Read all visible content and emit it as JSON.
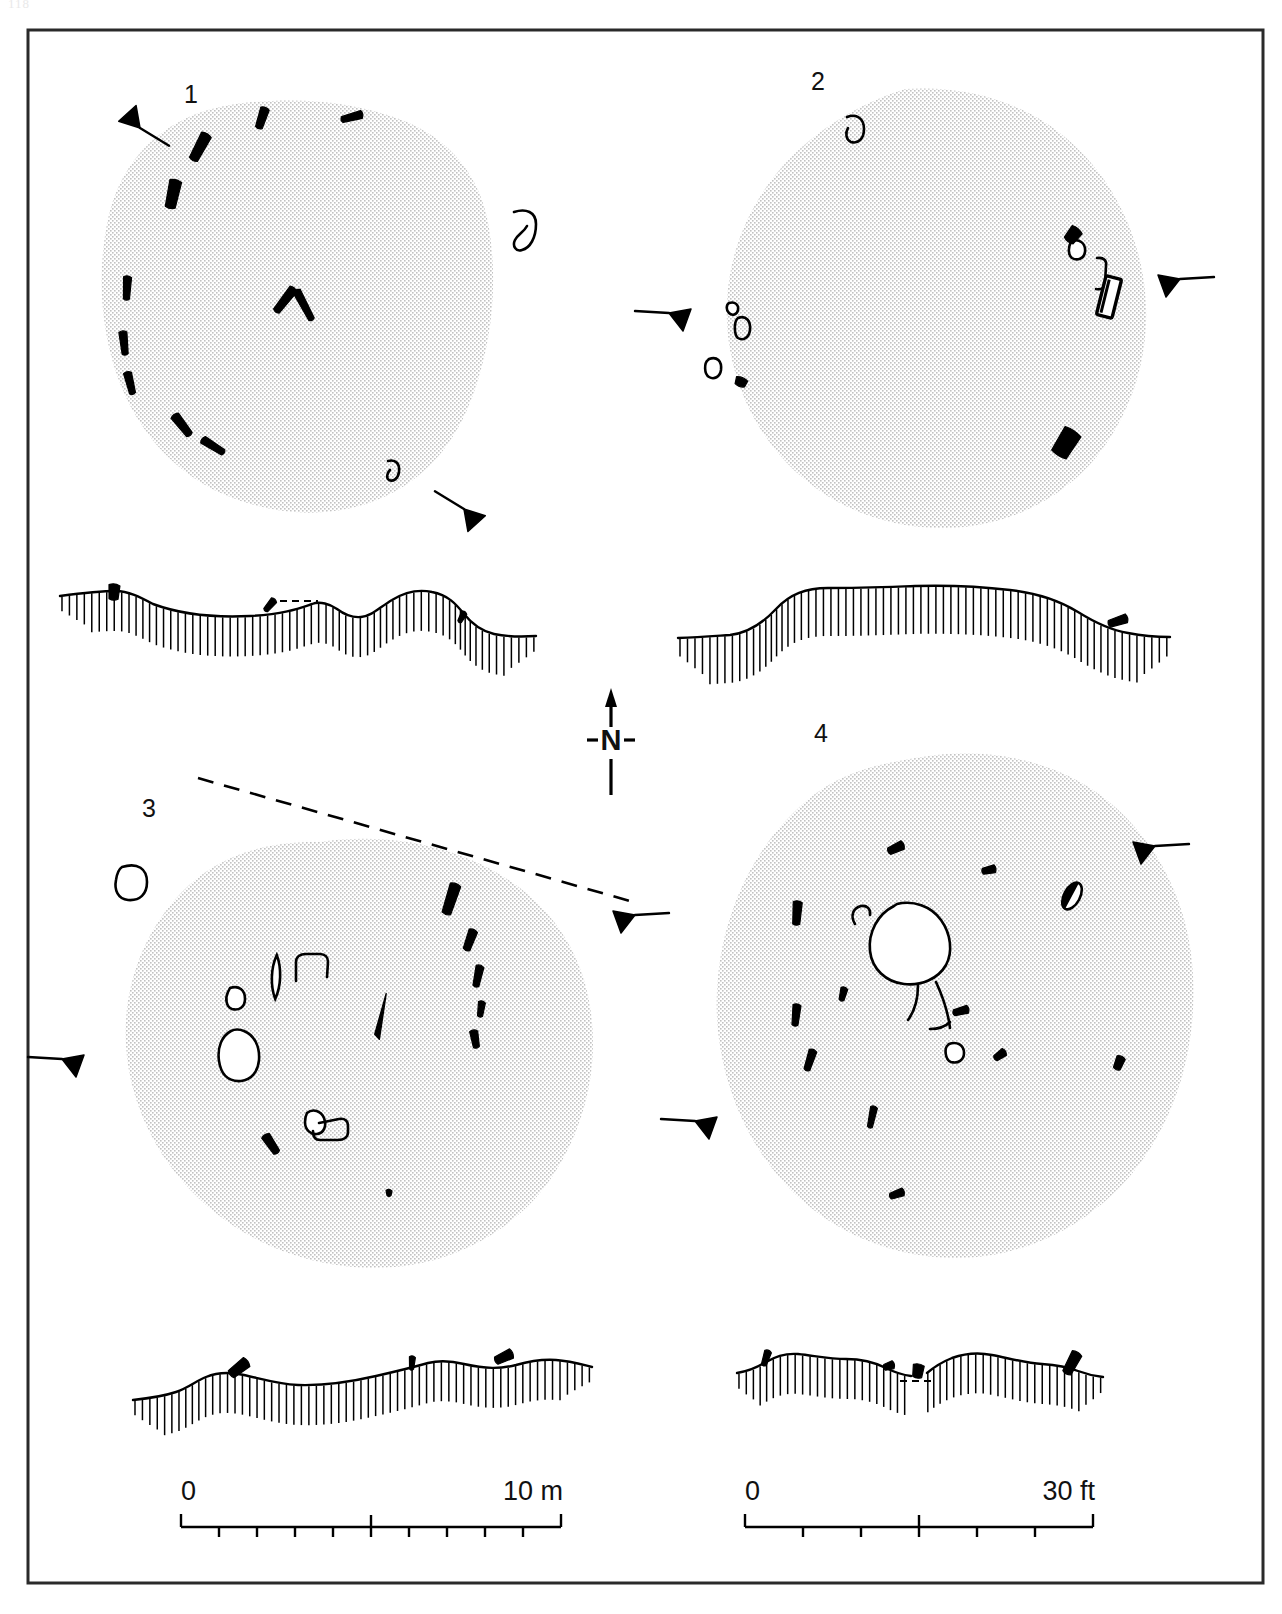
{
  "figure": {
    "page_number": "118",
    "border_color": "#2a2a2a",
    "stipple_color": "#b9b9b9",
    "ink_color": "#000000"
  },
  "north_arrow": {
    "label": "N",
    "name": "north-arrow"
  },
  "plans": [
    {
      "id": "plan-1",
      "label": "1",
      "label_x": 191,
      "label_y": 103,
      "outline": "M 243,103 C 300,97 352,101 402,120 C 450,139 481,176 489,228 C 498,283 492,341 474,392 C 456,444 424,481 377,500 C 327,520 271,515 223,494 C 173,472 137,430 118,378 C 100,327 97,272 108,219 C 119,169 150,132 196,114 C 212,108 228,105 243,103 Z",
      "stones": [
        {
          "name": "stone",
          "type": "slab",
          "x": 200,
          "y": 147,
          "w": 11,
          "h": 30,
          "rot": 28,
          "fill": "solid"
        },
        {
          "name": "stone",
          "type": "slab",
          "x": 262,
          "y": 118,
          "w": 9,
          "h": 22,
          "rot": 18,
          "fill": "solid"
        },
        {
          "name": "stone",
          "type": "slab",
          "x": 352,
          "y": 117,
          "w": 8,
          "h": 22,
          "rot": 75,
          "fill": "solid"
        },
        {
          "name": "stone",
          "type": "slab",
          "x": 173,
          "y": 194,
          "w": 12,
          "h": 29,
          "rot": 12,
          "fill": "solid"
        },
        {
          "name": "stone",
          "type": "slab",
          "x": 127,
          "y": 288,
          "w": 8,
          "h": 24,
          "rot": 3,
          "fill": "solid"
        },
        {
          "name": "stone",
          "type": "slab",
          "x": 124,
          "y": 343,
          "w": 8,
          "h": 24,
          "rot": -6,
          "fill": "solid"
        },
        {
          "name": "stone",
          "type": "slab",
          "x": 130,
          "y": 383,
          "w": 8,
          "h": 23,
          "rot": -14,
          "fill": "solid"
        },
        {
          "name": "stone",
          "type": "slab",
          "x": 182,
          "y": 425,
          "w": 9,
          "h": 26,
          "rot": -38,
          "fill": "solid"
        },
        {
          "name": "stone",
          "type": "slab",
          "x": 213,
          "y": 446,
          "w": 8,
          "h": 26,
          "rot": -58,
          "fill": "solid"
        },
        {
          "name": "stone",
          "type": "chevron-left",
          "x": 285,
          "y": 300,
          "w": 9,
          "h": 30,
          "rot": 38,
          "fill": "solid"
        },
        {
          "name": "stone",
          "type": "chevron-right",
          "x": 304,
          "y": 305,
          "w": 8,
          "h": 34,
          "rot": -28,
          "fill": "solid"
        }
      ],
      "hollow_features": [
        {
          "name": "hollow-stone",
          "path": "M 514,212 C 526,208 536,212 536,224 C 536,238 530,248 522,250 C 516,252 512,246 515,240 C 518,234 524,232 527,226",
          "closed": false
        },
        {
          "name": "hollow-stone",
          "path": "M 388,461 C 396,459 400,464 399,472 C 398,479 393,482 389,480 C 386,478 387,473 390,470",
          "closed": false
        }
      ],
      "section_markers": [
        {
          "name": "section-marker",
          "x": 140,
          "y": 128,
          "rot": 208,
          "flip": false
        },
        {
          "name": "section-marker",
          "x": 464,
          "y": 509,
          "rot": 28,
          "flip": false
        }
      ]
    },
    {
      "id": "plan-2",
      "label": "2",
      "label_x": 818,
      "label_y": 90,
      "outline": "M 905,89 C 965,85 1022,101 1066,138 C 1112,177 1139,232 1145,291 C 1151,351 1134,409 1098,455 C 1061,501 1005,527 946,528 C 886,529 828,506 787,463 C 746,420 724,361 727,301 C 730,242 757,187 802,147 C 831,121 867,101 905,89 Z",
      "stones": [
        {
          "name": "stone",
          "type": "slab",
          "x": 1073,
          "y": 235,
          "w": 13,
          "h": 16,
          "rot": 38,
          "fill": "solid"
        },
        {
          "name": "stone",
          "type": "slab",
          "x": 1109,
          "y": 297,
          "w": 16,
          "h": 40,
          "rot": 14,
          "fill": "outline-bar"
        },
        {
          "name": "stone",
          "type": "slab",
          "x": 1066,
          "y": 443,
          "w": 19,
          "h": 29,
          "rot": 32,
          "fill": "solid"
        },
        {
          "name": "stone",
          "type": "slab",
          "x": 741,
          "y": 382,
          "w": 12,
          "h": 9,
          "rot": 20,
          "fill": "solid"
        }
      ],
      "hollow_features": [
        {
          "name": "hollow-stone",
          "path": "M 847,117 C 857,113 864,119 864,129 C 864,139 858,144 851,142 C 846,140 845,133 848,128",
          "closed": false
        },
        {
          "name": "hollow-stone",
          "path": "M 1071,241 C 1080,238 1086,244 1085,252 C 1084,259 1077,261 1072,258 C 1068,255 1068,247 1071,242 Z",
          "closed": true
        },
        {
          "name": "hollow-stone",
          "path": "M 1097,258 C 1104,257 1107,261 1106,266 L 1105,283 C 1105,288 1101,290 1096,289",
          "closed": false
        },
        {
          "name": "hollow-stone",
          "path": "M 729,303 C 735,301 739,305 738,310 C 737,315 732,316 729,313 C 726,310 726,305 729,303 Z",
          "closed": true
        },
        {
          "name": "hollow-stone",
          "path": "M 738,318 C 746,315 751,321 750,330 C 749,338 743,341 738,338 C 734,335 734,323 737,319",
          "closed": false
        },
        {
          "name": "hollow-stone",
          "path": "M 709,359 C 717,356 722,361 721,370 C 720,377 714,380 709,377 C 704,374 704,363 708,360 Z",
          "closed": true
        }
      ],
      "section_markers": [
        {
          "name": "section-marker",
          "x": 669,
          "y": 313,
          "rot": 0,
          "flip": false
        },
        {
          "name": "section-marker",
          "x": 1180,
          "y": 279,
          "rot": 0,
          "flip": true
        }
      ]
    },
    {
      "id": "plan-3",
      "label": "3",
      "label_x": 149,
      "label_y": 817,
      "outline": "M 320,842 C 383,833 446,843 499,874 C 552,905 584,955 591,1013 C 599,1074 582,1136 547,1184 C 510,1233 454,1262 395,1267 C 331,1272 267,1253 217,1214 C 167,1175 134,1118 127,1057 C 120,996 140,936 181,893 C 218,854 268,841 320,842 Z",
      "stones": [
        {
          "name": "stone",
          "type": "slab",
          "x": 451,
          "y": 899,
          "w": 11,
          "h": 32,
          "rot": 18,
          "fill": "solid"
        },
        {
          "name": "stone",
          "type": "slab",
          "x": 470,
          "y": 940,
          "w": 9,
          "h": 22,
          "rot": 20,
          "fill": "solid"
        },
        {
          "name": "stone",
          "type": "slab",
          "x": 478,
          "y": 976,
          "w": 8,
          "h": 22,
          "rot": 12,
          "fill": "solid"
        },
        {
          "name": "stone",
          "type": "slab",
          "x": 481,
          "y": 1009,
          "w": 7,
          "h": 16,
          "rot": 8,
          "fill": "solid"
        },
        {
          "name": "stone",
          "type": "slab",
          "x": 475,
          "y": 1039,
          "w": 8,
          "h": 18,
          "rot": -10,
          "fill": "solid"
        },
        {
          "name": "stone",
          "type": "slab",
          "x": 271,
          "y": 1144,
          "w": 9,
          "h": 22,
          "rot": -34,
          "fill": "solid"
        },
        {
          "name": "stone",
          "type": "slab",
          "x": 389,
          "y": 1193,
          "w": 6,
          "h": 7,
          "rot": 0,
          "fill": "solid"
        },
        {
          "name": "stone",
          "type": "slab",
          "x": 381,
          "y": 1016,
          "w": 8,
          "h": 46,
          "rot": 13,
          "fill": "thin-solid"
        },
        {
          "name": "stone",
          "type": "slab",
          "x": 276,
          "y": 977,
          "w": 11,
          "h": 44,
          "rot": 2,
          "fill": "lens"
        }
      ],
      "hollow_features": [
        {
          "name": "hollow-stone",
          "path": "M 122,867 C 138,862 147,869 147,882 C 147,894 140,901 128,900 C 118,899 114,890 116,880 C 117,873 119,869 122,867 Z",
          "closed": true
        },
        {
          "name": "hollow-stone",
          "path": "M 231,1031 C 222,1036 217,1047 219,1061 C 221,1075 229,1082 241,1081 C 251,1080 258,1072 259,1060 C 260,1046 254,1035 244,1031 C 239,1029 235,1029 231,1031 Z",
          "closed": true
        },
        {
          "name": "hollow-stone",
          "path": "M 230,988 C 239,985 245,990 245,999 C 245,1007 239,1011 232,1009 C 226,1007 225,998 228,992 Z",
          "closed": true
        },
        {
          "name": "hollow-stone",
          "path": "M 296,981 L 296,962 C 296,957 300,954 306,954 L 320,954 C 325,954 328,957 328,962 L 327,977",
          "closed": false
        },
        {
          "name": "hollow-stone",
          "path": "M 307,1113 C 313,1108 321,1111 324,1118 C 327,1126 324,1133 317,1134 C 311,1135 305,1130 305,1122 C 305,1118 306,1115 307,1113 Z",
          "closed": true
        },
        {
          "name": "hollow-stone",
          "path": "M 319,1123 L 339,1119 C 345,1118 348,1121 348,1126 L 348,1132 C 348,1137 344,1140 338,1140 L 320,1140 C 315,1140 313,1136 313,1131",
          "closed": false
        }
      ],
      "section_markers": [
        {
          "name": "section-marker",
          "x": 62,
          "y": 1059,
          "rot": 0,
          "flip": false
        },
        {
          "name": "section-marker",
          "x": 635,
          "y": 915,
          "rot": 0,
          "flip": true
        }
      ],
      "dashed_line": "M 198,778 L 630,901"
    },
    {
      "id": "plan-4",
      "label": "4",
      "label_x": 821,
      "label_y": 742,
      "outline": "M 922,757 C 990,746 1059,761 1108,801 C 1160,844 1190,907 1193,975 C 1197,1050 1175,1123 1130,1176 C 1085,1229 1019,1259 953,1258 C 884,1257 818,1226 775,1172 C 731,1117 711,1045 718,977 C 725,903 760,836 815,794 C 847,770 884,763 922,757 Z",
      "stones": [
        {
          "name": "stone",
          "type": "slab",
          "x": 896,
          "y": 848,
          "w": 9,
          "h": 17,
          "rot": 65,
          "fill": "solid"
        },
        {
          "name": "stone",
          "type": "slab",
          "x": 989,
          "y": 870,
          "w": 8,
          "h": 14,
          "rot": 78,
          "fill": "solid"
        },
        {
          "name": "stone",
          "type": "slab",
          "x": 1072,
          "y": 896,
          "w": 16,
          "h": 29,
          "rot": 28,
          "fill": "half"
        },
        {
          "name": "stone",
          "type": "slab",
          "x": 797,
          "y": 913,
          "w": 9,
          "h": 24,
          "rot": 4,
          "fill": "solid"
        },
        {
          "name": "stone",
          "type": "slab",
          "x": 843,
          "y": 994,
          "w": 7,
          "h": 14,
          "rot": 14,
          "fill": "solid"
        },
        {
          "name": "stone",
          "type": "slab",
          "x": 796,
          "y": 1015,
          "w": 8,
          "h": 22,
          "rot": 6,
          "fill": "solid"
        },
        {
          "name": "stone",
          "type": "slab",
          "x": 810,
          "y": 1060,
          "w": 8,
          "h": 22,
          "rot": 18,
          "fill": "solid"
        },
        {
          "name": "stone",
          "type": "slab",
          "x": 872,
          "y": 1117,
          "w": 7,
          "h": 22,
          "rot": 12,
          "fill": "solid"
        },
        {
          "name": "stone",
          "type": "slab",
          "x": 897,
          "y": 1194,
          "w": 8,
          "h": 15,
          "rot": 70,
          "fill": "solid"
        },
        {
          "name": "stone",
          "type": "slab",
          "x": 1119,
          "y": 1063,
          "w": 9,
          "h": 14,
          "rot": 22,
          "fill": "solid"
        },
        {
          "name": "stone",
          "type": "slab",
          "x": 1000,
          "y": 1055,
          "w": 8,
          "h": 13,
          "rot": 55,
          "fill": "solid"
        },
        {
          "name": "stone",
          "type": "slab",
          "x": 961,
          "y": 1011,
          "w": 8,
          "h": 16,
          "rot": 75,
          "fill": "solid"
        }
      ],
      "hollow_features": [
        {
          "name": "cist-chamber",
          "path": "M 897,904 C 913,900 931,906 941,920 C 951,934 953,952 946,965 C 938,979 921,986 904,984 C 886,982 872,969 870,951 C 868,932 878,914 894,906 Z",
          "closed": true
        },
        {
          "name": "passage-wall-left",
          "path": "M 918,985 C 918,1001 914,1012 908,1020",
          "closed": false
        },
        {
          "name": "passage-wall-right",
          "path": "M 936,982 C 943,997 948,1012 950,1028",
          "closed": false
        },
        {
          "name": "passage-wall-outer",
          "path": "M 950,1022 C 946,1026 938,1029 930,1029",
          "closed": false
        },
        {
          "name": "hollow-stone",
          "path": "M 855,924 C 850,916 853,908 861,906 C 867,905 871,909 870,915",
          "closed": false
        },
        {
          "name": "hollow-stone",
          "path": "M 949,1044 C 957,1041 964,1045 964,1053 C 964,1060 958,1064 951,1062 C 945,1060 944,1048 948,1045 Z",
          "closed": true
        }
      ],
      "section_markers": [
        {
          "name": "section-marker",
          "x": 1155,
          "y": 846,
          "rot": 0,
          "flip": true
        },
        {
          "name": "section-marker",
          "x": 695,
          "y": 1121,
          "rot": 0,
          "flip": false
        }
      ]
    }
  ],
  "profiles": [
    {
      "id": "profile-1",
      "name": "profile-section-1",
      "terrain": "M 60,596 C 90,592 104,591 116,591 C 128,591 140,597 153,604 C 180,614 210,618 250,616 C 285,614 300,608 312,604 C 320,601 330,604 337,609 C 345,615 352,618 361,617 C 372,616 380,607 392,600 C 405,592 418,589 432,592 C 448,595 456,604 464,614 C 472,624 481,631 494,634 C 508,637 520,637 536,636",
      "stones": [
        {
          "name": "profile-stone",
          "x": 114,
          "y": 592,
          "w": 11,
          "h": 16,
          "rot": 4,
          "fill": "solid"
        },
        {
          "name": "profile-stone",
          "x": 270,
          "y": 605,
          "w": 7,
          "h": 15,
          "rot": 40,
          "fill": "solid"
        },
        {
          "name": "profile-stone",
          "x": 462,
          "y": 617,
          "w": 6,
          "h": 12,
          "rot": 28,
          "fill": "solid"
        }
      ],
      "dashed": "M 280,601 L 318,601"
    },
    {
      "id": "profile-2",
      "name": "profile-section-2",
      "terrain": "M 678,638 C 700,637 714,636 730,635 C 748,633 762,624 776,609 C 790,594 806,588 828,588 C 860,588 885,587 915,586 C 950,585 985,587 1010,590 C 1038,593 1060,601 1078,612 C 1094,622 1110,630 1128,633 C 1143,636 1155,637 1170,637",
      "stones": [
        {
          "name": "profile-stone",
          "x": 1118,
          "y": 621,
          "w": 9,
          "h": 20,
          "rot": 72,
          "fill": "solid"
        }
      ],
      "dashed": ""
    },
    {
      "id": "profile-3",
      "name": "profile-section-3",
      "terrain": "M 133,1400 C 152,1398 164,1396 176,1392 C 188,1388 196,1381 206,1377 C 218,1372 230,1372 244,1375 C 262,1379 278,1384 298,1385 C 326,1386 350,1382 376,1376 C 398,1371 414,1367 428,1363 C 440,1360 452,1361 464,1364 C 486,1369 500,1369 516,1365 C 530,1361 542,1359 556,1360 C 570,1361 580,1364 592,1367",
      "stones": [
        {
          "name": "profile-stone",
          "x": 239,
          "y": 1368,
          "w": 11,
          "h": 22,
          "rot": 52,
          "fill": "solid"
        },
        {
          "name": "profile-stone",
          "x": 412,
          "y": 1363,
          "w": 6,
          "h": 14,
          "rot": 4,
          "fill": "solid"
        },
        {
          "name": "profile-stone",
          "x": 504,
          "y": 1357,
          "w": 10,
          "h": 19,
          "rot": 65,
          "fill": "solid"
        }
      ],
      "dashed": ""
    },
    {
      "id": "profile-4",
      "name": "profile-section-4",
      "terrain": "M 737,1373 C 750,1371 758,1367 766,1362 C 776,1356 786,1353 798,1354 C 816,1356 830,1359 846,1359 C 864,1359 876,1363 886,1368 C 894,1372 902,1375 911,1376 M 927,1373 C 934,1367 942,1362 952,1358 C 966,1353 978,1352 992,1355 C 1012,1359 1026,1363 1042,1364 C 1058,1365 1068,1367 1078,1371 C 1086,1374 1094,1376 1103,1377",
      "stones": [
        {
          "name": "profile-stone",
          "x": 766,
          "y": 1358,
          "w": 7,
          "h": 16,
          "rot": 18,
          "fill": "solid"
        },
        {
          "name": "profile-stone",
          "x": 889,
          "y": 1366,
          "w": 8,
          "h": 11,
          "rot": 72,
          "fill": "solid"
        },
        {
          "name": "profile-stone",
          "x": 918,
          "y": 1371,
          "w": 11,
          "h": 14,
          "rot": 8,
          "fill": "solid"
        },
        {
          "name": "profile-stone",
          "x": 1072,
          "y": 1363,
          "w": 11,
          "h": 24,
          "rot": 28,
          "fill": "solid"
        }
      ],
      "dashed": "M 900,1381 L 935,1381"
    }
  ],
  "scales": [
    {
      "id": "scale-metric",
      "name": "scale-bar-metric",
      "left_label": "0",
      "right_label": "10 m",
      "x": 181,
      "y": 1527,
      "width": 380,
      "divisions": 10,
      "major_tick_index": 5,
      "left_label_x": 181,
      "left_label_y": 1500,
      "right_label_x": 563,
      "right_label_y": 1500
    },
    {
      "id": "scale-imperial",
      "name": "scale-bar-imperial",
      "left_label": "0",
      "right_label": "30 ft",
      "x": 745,
      "y": 1527,
      "width": 348,
      "divisions": 6,
      "major_tick_index": 3,
      "left_label_x": 745,
      "left_label_y": 1500,
      "right_label_x": 1095,
      "right_label_y": 1500
    }
  ]
}
